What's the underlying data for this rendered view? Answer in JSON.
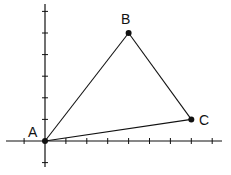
{
  "diagram": {
    "type": "triangle-on-coordinate-grid",
    "axes": {
      "origin_px": [
        45,
        141
      ],
      "x_unit_px": 20.9,
      "y_unit_px": 21.6,
      "x_ticks": [
        -1,
        0,
        1,
        2,
        3,
        4,
        5,
        6,
        7,
        8
      ],
      "y_ticks": [
        -1,
        0,
        1,
        2,
        3,
        4,
        5,
        6
      ]
    },
    "points": [
      {
        "label": "A",
        "x": 0,
        "y": 0
      },
      {
        "label": "B",
        "x": 4,
        "y": 5
      },
      {
        "label": "C",
        "x": 7,
        "y": 1
      }
    ],
    "segments": [
      [
        "A",
        "B"
      ],
      [
        "B",
        "C"
      ],
      [
        "C",
        "A"
      ]
    ],
    "colors": {
      "stroke": "#111111",
      "background": "#ffffff"
    }
  }
}
